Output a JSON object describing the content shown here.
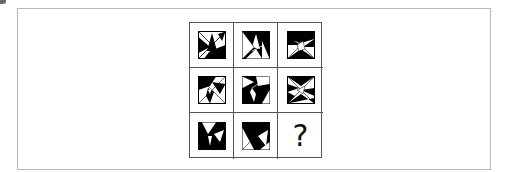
{
  "puzzle": {
    "type": "3x3 matrix reasoning",
    "cells": [
      {
        "row": 1,
        "col": 1,
        "content": "figure",
        "name": "tile-r1c1"
      },
      {
        "row": 1,
        "col": 2,
        "content": "figure",
        "name": "tile-r1c2"
      },
      {
        "row": 1,
        "col": 3,
        "content": "figure",
        "name": "tile-r1c3"
      },
      {
        "row": 2,
        "col": 1,
        "content": "figure",
        "name": "tile-r2c1"
      },
      {
        "row": 2,
        "col": 2,
        "content": "figure",
        "name": "tile-r2c2"
      },
      {
        "row": 2,
        "col": 3,
        "content": "figure",
        "name": "tile-r2c3"
      },
      {
        "row": 3,
        "col": 1,
        "content": "figure",
        "name": "tile-r3c1"
      },
      {
        "row": 3,
        "col": 2,
        "content": "figure",
        "name": "tile-r3c2"
      },
      {
        "row": 3,
        "col": 3,
        "content": "missing",
        "name": "missing-cell"
      }
    ],
    "missing_label": "?"
  },
  "colors": {
    "fill": "#000000",
    "background": "#ffffff",
    "grid_line": "#555555",
    "frame_line": "#b8b8b8"
  }
}
